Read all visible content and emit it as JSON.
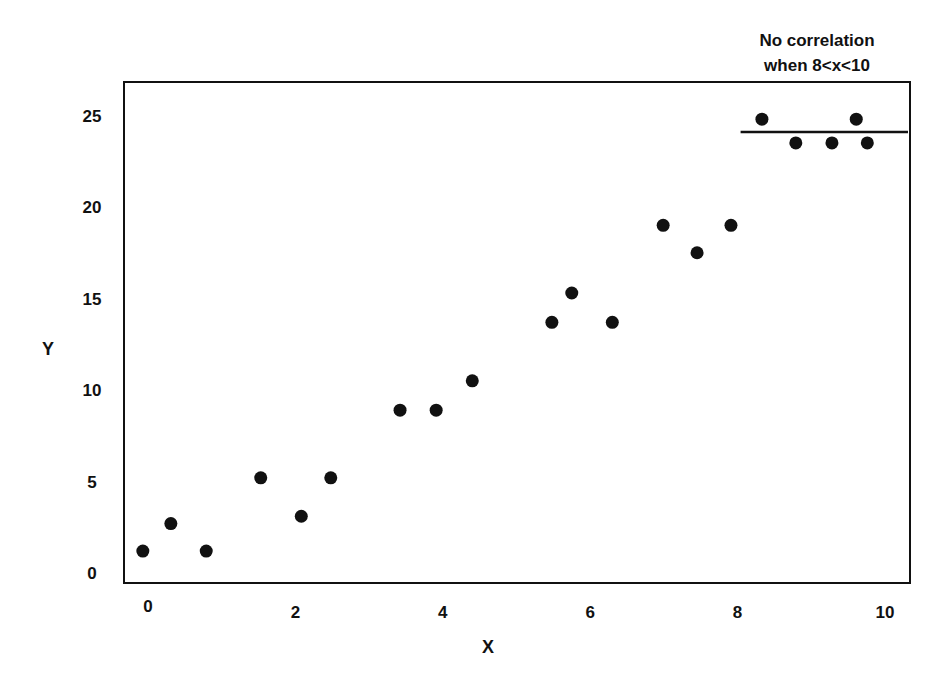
{
  "chart_data": {
    "type": "scatter",
    "title": "",
    "xlabel": "X",
    "ylabel": "Y",
    "xlim": [
      -0.35,
      10.3
    ],
    "ylim": [
      -0.6,
      27.3
    ],
    "x_ticks": [
      0,
      2,
      4,
      6,
      8,
      10
    ],
    "y_ticks": [
      0,
      5,
      10,
      15,
      20,
      25
    ],
    "x_tick_labels": [
      "0",
      "2",
      "4",
      "6",
      "8",
      "10"
    ],
    "y_tick_labels": [
      "0",
      "5",
      "10",
      "15",
      "20",
      "25"
    ],
    "grid": false,
    "legend": null,
    "marker_color": "#111111",
    "series": [
      {
        "name": "data",
        "points": [
          {
            "x": -0.07,
            "y": 1.2
          },
          {
            "x": 0.31,
            "y": 2.7
          },
          {
            "x": 0.79,
            "y": 1.2
          },
          {
            "x": 1.53,
            "y": 5.2
          },
          {
            "x": 2.08,
            "y": 3.1
          },
          {
            "x": 2.48,
            "y": 5.2
          },
          {
            "x": 3.42,
            "y": 8.9
          },
          {
            "x": 3.91,
            "y": 8.9
          },
          {
            "x": 4.4,
            "y": 10.5
          },
          {
            "x": 5.48,
            "y": 13.7
          },
          {
            "x": 5.75,
            "y": 15.3
          },
          {
            "x": 6.3,
            "y": 13.7
          },
          {
            "x": 6.99,
            "y": 19.0
          },
          {
            "x": 7.45,
            "y": 17.5
          },
          {
            "x": 7.91,
            "y": 19.0
          },
          {
            "x": 8.33,
            "y": 24.8
          },
          {
            "x": 8.79,
            "y": 23.5
          },
          {
            "x": 9.28,
            "y": 23.5
          },
          {
            "x": 9.61,
            "y": 24.8
          },
          {
            "x": 9.76,
            "y": 23.5
          }
        ]
      }
    ],
    "reference_lines": [
      {
        "type": "horizontal",
        "y": 24.1,
        "x_from": 8.0,
        "x_to": 10.3
      }
    ],
    "annotations": [
      {
        "text_lines": [
          "No correlation",
          "when 8<x<10"
        ],
        "anchor_x": 8.96,
        "position": "above plot, top-right"
      }
    ]
  }
}
